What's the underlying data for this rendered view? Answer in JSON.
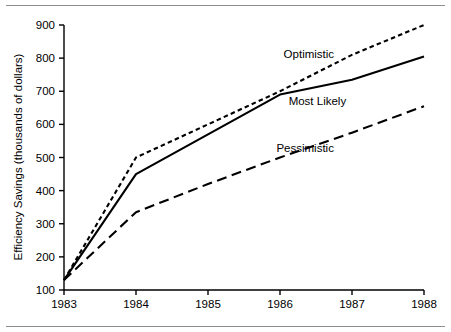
{
  "figure": {
    "background_color": "#ffffff",
    "ink_color": "#000000",
    "rule_color": "#8d8d8d",
    "top_rule": "horizontal-rule",
    "bottom_rule": "horizontal-rule"
  },
  "chart_data": {
    "type": "line",
    "title": "",
    "xlabel": "",
    "ylabel": "Efficiency Savings (thousands of dollars)",
    "x": [
      1983,
      1984,
      1985,
      1986,
      1987,
      1988
    ],
    "categories": [
      "1983",
      "1984",
      "1985",
      "1986",
      "1987",
      "1988"
    ],
    "xticklabels": [
      "1983",
      "1984",
      "1985",
      "1986",
      "1987",
      "1988"
    ],
    "yticklabels": [
      "100",
      "200",
      "300",
      "400",
      "500",
      "600",
      "700",
      "800",
      "900"
    ],
    "yticks": [
      100,
      200,
      300,
      400,
      500,
      600,
      700,
      800,
      900
    ],
    "xlim": [
      1983,
      1988
    ],
    "ylim": [
      100,
      900
    ],
    "grid": false,
    "legend_position": "inline-annotations",
    "series": [
      {
        "name": "Optimistic",
        "style": "dotted",
        "color": "#000000",
        "values": [
          130,
          500,
          600,
          700,
          810,
          900
        ],
        "label_text": "Optimistic",
        "label_x": 1986.05,
        "label_y": 800
      },
      {
        "name": "Most Likely",
        "style": "solid",
        "color": "#000000",
        "values": [
          130,
          450,
          570,
          690,
          735,
          805
        ],
        "label_text": "Most Likely",
        "label_x": 1986.12,
        "label_y": 660
      },
      {
        "name": "Pessimistic",
        "style": "dashed",
        "color": "#000000",
        "values": [
          130,
          335,
          420,
          500,
          575,
          655
        ],
        "label_text": "Pessimistic",
        "label_x": 1985.95,
        "label_y": 518
      }
    ]
  }
}
